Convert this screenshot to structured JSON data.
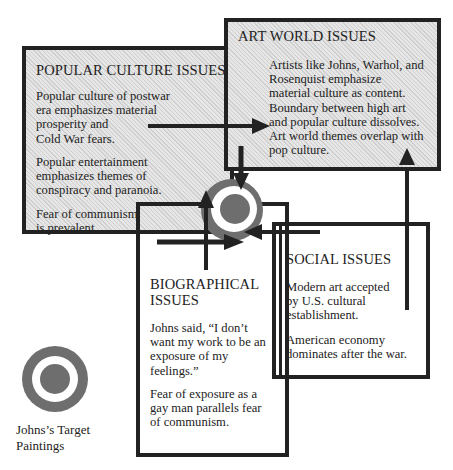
{
  "popular_culture": {
    "title": "POPULAR CULTURE ISSUES",
    "paragraphs": [
      "Popular culture of postwar era emphasizes material prosperity and Cold War fears.",
      "Popular entertainment emphasizes themes of conspiracy and paranoia.",
      "Fear of communism is prevalent."
    ],
    "lines": [
      [
        "Popular culture of postwar",
        "era emphasizes material",
        "prosperity and",
        "Cold War fears."
      ],
      [
        "Popular entertainment",
        "emphasizes themes of",
        "conspiracy and paranoia."
      ],
      [
        "Fear of communism",
        "is prevalent."
      ]
    ]
  },
  "art_world": {
    "title": "ART WORLD ISSUES",
    "lines": [
      "Artists like Johns, Warhol, and",
      "Rosenquist emphasize",
      "material culture as content.",
      "Boundary between high art",
      "and popular culture dissolves.",
      "Art world themes overlap with",
      "pop culture."
    ]
  },
  "biographical": {
    "title_lines": [
      "BIOGRAPHICAL",
      "ISSUES"
    ],
    "lines": [
      [
        "Johns said,  “I don’t",
        "want my work to be an",
        "exposure of my",
        "feelings.”"
      ],
      [
        "Fear of exposure as a",
        "gay man parallels fear",
        "of communism."
      ]
    ]
  },
  "social": {
    "title": "SOCIAL ISSUES",
    "lines": [
      [
        "Modern art accepted",
        "by U.S. cultural",
        "establishment."
      ],
      [
        "American economy",
        "dominates after the war."
      ]
    ]
  },
  "legend": {
    "icon": "target-icon",
    "caption_lines": [
      "Johns’s Target",
      "Paintings"
    ]
  },
  "colors": {
    "border": "#222222",
    "target_gray": "#6e6e6e",
    "hatch_bg": "#dcdcdc"
  }
}
